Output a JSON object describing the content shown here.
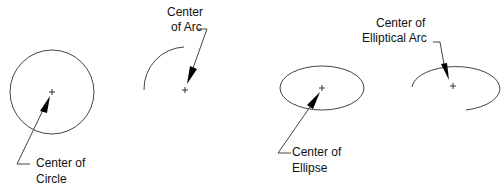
{
  "diagram": {
    "colors": {
      "stroke": "#333333",
      "text": "#111111",
      "background": "#ffffff"
    },
    "figures": [
      {
        "id": "circle",
        "shape": "circle",
        "label_lines": [
          "Center of",
          "Circle"
        ]
      },
      {
        "id": "arc",
        "shape": "arc",
        "label_lines": [
          "Center",
          "of Arc"
        ]
      },
      {
        "id": "ellipse",
        "shape": "ellipse",
        "label_lines": [
          "Center of",
          "Ellipse"
        ]
      },
      {
        "id": "elliptical-arc",
        "shape": "elliptical-arc",
        "label_lines": [
          "Center of",
          "Elliptical Arc"
        ]
      }
    ],
    "center_marker_icon": "plus-crosshair",
    "leader_icon": "arrowhead"
  }
}
